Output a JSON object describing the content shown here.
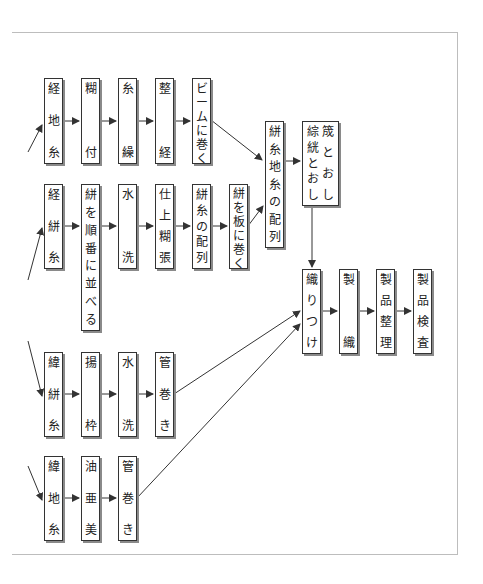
{
  "diagram": {
    "title": "",
    "colors": {
      "line": "#333333",
      "box_border": "#333333",
      "shadow": "#8a8a8a",
      "frame": "#bdbdbd"
    },
    "rows": {
      "warp_ground": [
        {
          "id": "keiji",
          "label": "経地糸",
          "chars": [
            "経",
            "地",
            "糸"
          ]
        },
        {
          "id": "norizuke",
          "label": "糊付",
          "chars": [
            "糊",
            "付"
          ]
        },
        {
          "id": "itokuri",
          "label": "糸繰",
          "chars": [
            "糸",
            "繰"
          ]
        },
        {
          "id": "seikei",
          "label": "整経",
          "chars": [
            "整",
            "経"
          ]
        },
        {
          "id": "beam",
          "label": "ビームに巻く",
          "chars": [
            "ビ",
            "ー",
            "ム",
            "に",
            "巻",
            "く"
          ]
        }
      ],
      "warp_kasuri": [
        {
          "id": "keikasuri",
          "label": "経絣糸",
          "chars": [
            "経",
            "絣",
            "糸"
          ]
        },
        {
          "id": "junban",
          "label": "絣を順番に並べる",
          "chars": [
            "絣",
            "を",
            "順",
            "番",
            "に",
            "並",
            "べ",
            "る"
          ]
        },
        {
          "id": "suisen1",
          "label": "水洗",
          "chars": [
            "水",
            "洗"
          ]
        },
        {
          "id": "shiage",
          "label": "仕上糊張",
          "chars": [
            "仕",
            "上",
            "糊",
            "張"
          ]
        },
        {
          "id": "kasuri_hairetsu",
          "label": "絣糸の配列",
          "chars": [
            "絣",
            "糸",
            "の",
            "配",
            "列"
          ]
        },
        {
          "id": "itaomaku",
          "label": "絣を板に巻く",
          "chars": [
            "絣",
            "を",
            "板",
            "に",
            "巻",
            "く"
          ]
        }
      ],
      "merge": [
        {
          "id": "hairetsu",
          "label": "絣糸地糸の配列",
          "chars": [
            "絣",
            "糸",
            "地",
            "糸",
            "の",
            "配",
            "列"
          ]
        },
        {
          "id": "tooshi",
          "label": "綜絖とおし・筬とおし",
          "col_left": [
            "綜",
            "絖",
            "と",
            "お",
            "し"
          ],
          "col_right": [
            "筬",
            "と",
            "お",
            "し"
          ]
        }
      ],
      "weft_kasuri": [
        {
          "id": "ikasuri",
          "label": "緯絣糸",
          "chars": [
            "緯",
            "絣",
            "糸"
          ]
        },
        {
          "id": "agewaku",
          "label": "揚枠",
          "chars": [
            "揚",
            "枠"
          ]
        },
        {
          "id": "suisen2",
          "label": "水洗",
          "chars": [
            "水",
            "洗"
          ]
        },
        {
          "id": "kudamaki1",
          "label": "管巻き",
          "chars": [
            "管",
            "巻",
            "き"
          ]
        }
      ],
      "weft_ground": [
        {
          "id": "iji",
          "label": "緯地糸",
          "chars": [
            "緯",
            "地",
            "糸"
          ]
        },
        {
          "id": "yuami",
          "label": "油亜美",
          "chars": [
            "油",
            "亜",
            "美"
          ]
        },
        {
          "id": "kudamaki2",
          "label": "管巻き",
          "chars": [
            "管",
            "巻",
            "き"
          ]
        }
      ],
      "final": [
        {
          "id": "oritsuke",
          "label": "織りつけ",
          "chars": [
            "織",
            "り",
            "つ",
            "け"
          ]
        },
        {
          "id": "seishoku",
          "label": "製織",
          "chars": [
            "製",
            "織"
          ]
        },
        {
          "id": "seihin_seiri",
          "label": "製品整理",
          "chars": [
            "製",
            "品",
            "整",
            "理"
          ]
        },
        {
          "id": "seihin_kensa",
          "label": "製品検査",
          "chars": [
            "製",
            "品",
            "検",
            "査"
          ]
        }
      ]
    }
  }
}
